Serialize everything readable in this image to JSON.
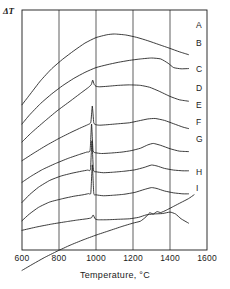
{
  "chart_data": {
    "type": "line",
    "title": "",
    "subtitle": "",
    "xlabel": "Temperature, °C",
    "ylabel": "ΔT",
    "xlim": [
      600,
      1600
    ],
    "ylim": [
      0,
      10
    ],
    "xticks": [
      600,
      800,
      1000,
      1200,
      1400,
      1600
    ],
    "xtick_labels": [
      "600",
      "800",
      "1000",
      "1200",
      "1400",
      "1600"
    ],
    "yticks": [],
    "ytick_labels": [],
    "grid": "vertical-only",
    "legend_position": "right-inline-curve-labels",
    "axis_color": "#1a1a1a",
    "curve_color": "#1a1a1a",
    "background": "#ffffff",
    "annotations": [
      "Sharp exothermic peaks near 980 °C on curves C–G",
      "Broad secondary exotherm near 1300 °C on curves D–G",
      "Curve I shows a step near 1270–1330 °C"
    ],
    "series": [
      {
        "name": "A",
        "label": "A",
        "x": [
          600,
          640,
          700,
          760,
          820,
          880,
          940,
          1000,
          1060,
          1100,
          1160,
          1220,
          1280,
          1340,
          1400,
          1450,
          1500
        ],
        "y": [
          6.05,
          6.45,
          7.05,
          7.55,
          7.95,
          8.3,
          8.62,
          8.85,
          8.97,
          9.0,
          8.96,
          8.86,
          8.72,
          8.56,
          8.4,
          8.26,
          8.14
        ]
      },
      {
        "name": "B",
        "label": "B",
        "x": [
          600,
          640,
          700,
          760,
          820,
          880,
          940,
          1000,
          1060,
          1120,
          1180,
          1240,
          1300,
          1350,
          1390,
          1420,
          1460,
          1500
        ],
        "y": [
          5.25,
          5.62,
          6.1,
          6.5,
          6.85,
          7.15,
          7.4,
          7.6,
          7.72,
          7.82,
          7.9,
          7.96,
          8.0,
          7.96,
          7.78,
          7.6,
          7.55,
          7.56
        ]
      },
      {
        "name": "C",
        "label": "C",
        "x": [
          600,
          650,
          720,
          790,
          860,
          920,
          960,
          975,
          982,
          990,
          1000,
          1020,
          1060,
          1120,
          1180,
          1240,
          1290,
          1340,
          1400,
          1450,
          1500
        ],
        "y": [
          4.5,
          4.88,
          5.35,
          5.8,
          6.2,
          6.55,
          6.78,
          6.9,
          7.08,
          6.9,
          6.82,
          6.8,
          6.82,
          6.86,
          6.88,
          6.86,
          6.78,
          6.62,
          6.4,
          6.26,
          6.2
        ]
      },
      {
        "name": "D",
        "label": "D",
        "x": [
          600,
          660,
          730,
          800,
          870,
          920,
          955,
          972,
          980,
          988,
          1000,
          1020,
          1060,
          1120,
          1180,
          1230,
          1280,
          1320,
          1370,
          1420,
          1470,
          1500
        ],
        "y": [
          3.72,
          4.02,
          4.35,
          4.65,
          4.92,
          5.1,
          5.22,
          5.32,
          6.0,
          5.3,
          5.22,
          5.2,
          5.22,
          5.26,
          5.3,
          5.38,
          5.46,
          5.48,
          5.4,
          5.26,
          5.12,
          5.06
        ]
      },
      {
        "name": "E",
        "label": "E",
        "x": [
          600,
          650,
          710,
          780,
          850,
          910,
          950,
          968,
          976,
          984,
          1000,
          1030,
          1080,
          1140,
          1190,
          1240,
          1280,
          1310,
          1350,
          1400,
          1450,
          1500
        ],
        "y": [
          2.82,
          3.08,
          3.35,
          3.6,
          3.82,
          3.98,
          4.08,
          4.15,
          5.25,
          4.14,
          4.05,
          4.02,
          4.04,
          4.08,
          4.14,
          4.24,
          4.38,
          4.44,
          4.36,
          4.22,
          4.12,
          4.1
        ]
      },
      {
        "name": "F",
        "label": "F",
        "x": [
          600,
          640,
          690,
          750,
          810,
          870,
          920,
          955,
          970,
          978,
          986,
          1000,
          1040,
          1090,
          1150,
          1210,
          1260,
          1300,
          1330,
          1370,
          1420,
          1470,
          1500
        ],
        "y": [
          1.98,
          2.3,
          2.62,
          2.9,
          3.08,
          3.2,
          3.28,
          3.33,
          3.36,
          4.55,
          3.34,
          3.26,
          3.22,
          3.24,
          3.28,
          3.34,
          3.44,
          3.54,
          3.5,
          3.4,
          3.33,
          3.3,
          3.3
        ]
      },
      {
        "name": "G",
        "label": "G",
        "x": [
          600,
          640,
          690,
          750,
          820,
          880,
          930,
          960,
          972,
          980,
          988,
          1000,
          1040,
          1090,
          1150,
          1210,
          1260,
          1300,
          1330,
          1370,
          1420,
          1470,
          1500
        ],
        "y": [
          1.22,
          1.5,
          1.78,
          2.0,
          2.14,
          2.24,
          2.3,
          2.35,
          2.38,
          3.55,
          2.36,
          2.3,
          2.26,
          2.28,
          2.32,
          2.4,
          2.52,
          2.6,
          2.56,
          2.46,
          2.38,
          2.34,
          2.34
        ]
      },
      {
        "name": "H",
        "label": "H",
        "x": [
          600,
          680,
          760,
          840,
          900,
          950,
          975,
          985,
          995,
          1010,
          1060,
          1120,
          1180,
          1230,
          1270,
          1310,
          1360,
          1400,
          1430,
          1460,
          1500
        ],
        "y": [
          0.82,
          0.96,
          1.08,
          1.18,
          1.25,
          1.3,
          1.34,
          1.46,
          1.3,
          1.26,
          1.26,
          1.28,
          1.3,
          1.36,
          1.46,
          1.5,
          1.52,
          1.58,
          1.5,
          1.3,
          1.12
        ]
      },
      {
        "name": "I",
        "label": "I",
        "x": [
          600,
          660,
          720,
          790,
          860,
          930,
          1000,
          1070,
          1140,
          1200,
          1240,
          1270,
          1290,
          1310,
          1330,
          1350,
          1380,
          1420,
          1460,
          1500,
          1530
        ],
        "y": [
          -0.85,
          -0.58,
          -0.32,
          -0.05,
          0.2,
          0.42,
          0.62,
          0.8,
          0.98,
          1.12,
          1.2,
          1.38,
          1.55,
          1.5,
          1.6,
          1.56,
          1.66,
          1.82,
          1.98,
          2.14,
          2.3
        ]
      }
    ]
  },
  "labels": {
    "ylabel": "ΔT",
    "xlabel": "Temperature, °C",
    "curve_labels": [
      {
        "text": "A",
        "y": 25
      },
      {
        "text": "B",
        "y": 43
      },
      {
        "text": "C",
        "y": 69
      },
      {
        "text": "D",
        "y": 88
      },
      {
        "text": "E",
        "y": 105
      },
      {
        "text": "F",
        "y": 122
      },
      {
        "text": "G",
        "y": 139
      },
      {
        "text": "H",
        "y": 172
      },
      {
        "text": "I",
        "y": 188
      }
    ],
    "xtick_labels": [
      {
        "text": "600",
        "x": 22
      },
      {
        "text": "800",
        "x": 59
      },
      {
        "text": "1000",
        "x": 96
      },
      {
        "text": "1200",
        "x": 133
      },
      {
        "text": "1400",
        "x": 170
      },
      {
        "text": "1600",
        "x": 207
      }
    ]
  }
}
